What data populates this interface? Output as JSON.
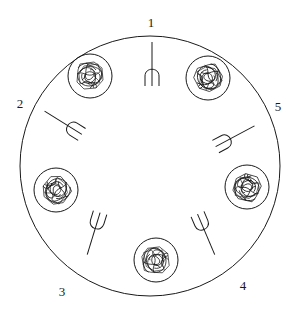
{
  "diagram": {
    "title": "",
    "colors": {
      "ink": "#1a1a1a",
      "background": "#ffffff"
    },
    "table": {
      "cx": 150,
      "cy": 166,
      "r": 130
    },
    "seat_labels": [
      {
        "id": "1",
        "text": "1",
        "x": 151,
        "y": 22
      },
      {
        "id": "2",
        "text": "2",
        "x": 20,
        "y": 103
      },
      {
        "id": "3",
        "text": "3",
        "x": 62,
        "y": 291
      },
      {
        "id": "4",
        "text": "4",
        "x": 243,
        "y": 285
      },
      {
        "id": "5",
        "text": "5",
        "x": 278,
        "y": 106
      }
    ],
    "plates": [
      {
        "name": "plate-upper-left",
        "cx": 90,
        "cy": 76,
        "r": 22
      },
      {
        "name": "plate-upper-right",
        "cx": 208,
        "cy": 78,
        "r": 22
      },
      {
        "name": "plate-left",
        "cx": 56,
        "cy": 190,
        "r": 22
      },
      {
        "name": "plate-right",
        "cx": 247,
        "cy": 187,
        "r": 22
      },
      {
        "name": "plate-bottom",
        "cx": 156,
        "cy": 260,
        "r": 22
      }
    ],
    "forks": [
      {
        "name": "fork-1",
        "x": 152,
        "y": 72,
        "angle": 0
      },
      {
        "name": "fork-2",
        "x": 70,
        "y": 127,
        "angle": -58
      },
      {
        "name": "fork-5",
        "x": 228,
        "y": 140,
        "angle": 62
      },
      {
        "name": "fork-3",
        "x": 96,
        "y": 226,
        "angle": 197
      },
      {
        "name": "fork-4",
        "x": 203,
        "y": 227,
        "angle": 157
      }
    ]
  }
}
